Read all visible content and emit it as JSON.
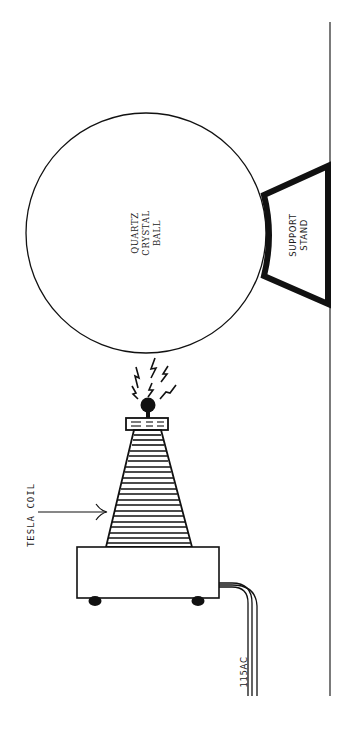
{
  "figure": {
    "labels": {
      "crystal_ball": [
        "QUARTZ",
        "CRYSTAL",
        "BALL"
      ],
      "support_stand": [
        "SUPPORT",
        "STAND"
      ],
      "tesla_coil": "TESLA COIL",
      "power": "115AC"
    },
    "colors": {
      "ink": "#111111",
      "paper": "#ffffff"
    }
  }
}
